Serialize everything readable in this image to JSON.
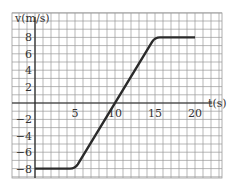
{
  "chart_data": {
    "type": "line",
    "title": "",
    "xlabel": "t (s)",
    "ylabel": "v (m/s)",
    "x_tick_labels": [
      "5",
      "10",
      "15",
      "20"
    ],
    "y_tick_labels": [
      "8",
      "6",
      "4",
      "2",
      "-2",
      "-4",
      "-6",
      "-8"
    ],
    "xlim": [
      -3,
      23
    ],
    "ylim": [
      -9,
      11
    ],
    "grid": true,
    "grid_step": {
      "x": 1,
      "y": 1
    },
    "series": [
      {
        "name": "velocity",
        "x": [
          0,
          5,
          15,
          20
        ],
        "y": [
          -8,
          -8,
          8,
          8
        ]
      }
    ],
    "line_color": "#2b2b2b",
    "grid_color": "#9a9a9a"
  },
  "labels": {
    "y_axis": "v(m/s)",
    "x_axis": "t(s)"
  }
}
